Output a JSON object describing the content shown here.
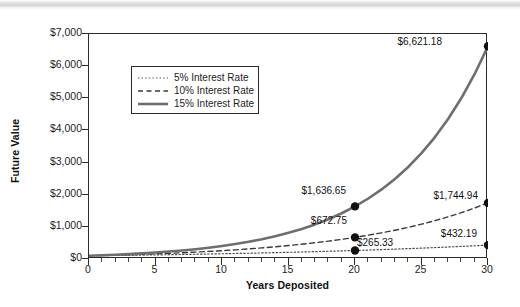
{
  "chart_data": {
    "type": "line",
    "title": "",
    "xlabel": "Years Deposited",
    "ylabel": "Future Value",
    "xlim": [
      0,
      30
    ],
    "ylim": [
      0,
      7000
    ],
    "grid": false,
    "legend_position": "upper-left-inside",
    "x_ticks": [
      0,
      5,
      10,
      15,
      20,
      25,
      30
    ],
    "x_tick_labels": [
      "0",
      "5",
      "10",
      "15",
      "20",
      "25",
      "30"
    ],
    "x_minor_tick_step": 1,
    "y_ticks": [
      0,
      1000,
      2000,
      3000,
      4000,
      5000,
      6000,
      7000
    ],
    "y_tick_labels": [
      "$0",
      "$1,000",
      "$2,000",
      "$3,000",
      "$4,000",
      "$5,000",
      "$6,000",
      "$7,000"
    ],
    "principal": 100,
    "x": [
      0,
      1,
      2,
      3,
      4,
      5,
      6,
      7,
      8,
      9,
      10,
      11,
      12,
      13,
      14,
      15,
      16,
      17,
      18,
      19,
      20,
      21,
      22,
      23,
      24,
      25,
      26,
      27,
      28,
      29,
      30
    ],
    "series": [
      {
        "name": "5% Interest Rate",
        "rate": 0.05,
        "style": "dotted",
        "color": "#4d4d4d",
        "width": 1.2,
        "values": [
          100,
          105,
          110.25,
          115.76,
          121.55,
          127.63,
          134.01,
          140.71,
          147.75,
          155.13,
          162.89,
          171.03,
          179.59,
          188.56,
          197.99,
          207.89,
          218.29,
          229.2,
          240.66,
          252.7,
          265.33,
          278.6,
          292.53,
          307.15,
          322.51,
          338.64,
          355.57,
          373.35,
          392.01,
          411.61,
          432.19
        ],
        "annotated_points": [
          {
            "x": 20,
            "y": 265.33,
            "label": "$265.33"
          },
          {
            "x": 30,
            "y": 432.19,
            "label": "$432.19"
          }
        ]
      },
      {
        "name": "10% Interest Rate",
        "rate": 0.1,
        "style": "dashed",
        "color": "#3a3a3a",
        "width": 1.4,
        "values": [
          100,
          110,
          121,
          133.1,
          146.41,
          161.05,
          177.16,
          194.87,
          214.36,
          235.79,
          259.37,
          285.31,
          313.84,
          345.23,
          379.75,
          417.72,
          459.5,
          505.45,
          555.99,
          611.59,
          672.75,
          740.02,
          814.03,
          895.43,
          984.97,
          1083.47,
          1191.82,
          1311,
          1442.1,
          1586.31,
          1744.94
        ],
        "annotated_points": [
          {
            "x": 20,
            "y": 672.75,
            "label": "$672.75"
          },
          {
            "x": 30,
            "y": 1744.94,
            "label": "$1,744.94"
          }
        ]
      },
      {
        "name": "15% Interest Rate",
        "rate": 0.15,
        "style": "solid",
        "color": "#6e6e6e",
        "width": 2.6,
        "values": [
          100,
          115,
          132.25,
          152.09,
          174.9,
          201.14,
          231.31,
          266.0,
          305.9,
          351.79,
          404.56,
          465.24,
          535.03,
          615.28,
          707.57,
          813.71,
          935.76,
          1076.13,
          1237.55,
          1423.18,
          1636.65,
          1882.15,
          2164.47,
          2489.14,
          2862.52,
          3291.9,
          3785.68,
          4353.53,
          5006.56,
          5757.55,
          6621.18
        ],
        "annotated_points": [
          {
            "x": 20,
            "y": 1636.65,
            "label": "$1,636.65"
          },
          {
            "x": 30,
            "y": 6621.18,
            "label": "$6,621.18"
          }
        ]
      }
    ]
  },
  "axes": {
    "y_title": "Future Value",
    "x_title": "Years Deposited"
  },
  "legend": {
    "entries": [
      {
        "label": "5% Interest Rate",
        "style": "dotted"
      },
      {
        "label": "10% Interest Rate",
        "style": "dashed"
      },
      {
        "label": "15% Interest Rate",
        "style": "solid"
      }
    ]
  },
  "annotations": [
    {
      "key": "p15y30",
      "text": "$6,621.18"
    },
    {
      "key": "p15y20",
      "text": "$1,636.65"
    },
    {
      "key": "p10y30",
      "text": "$1,744.94"
    },
    {
      "key": "p10y20",
      "text": "$672.75"
    },
    {
      "key": "p05y30",
      "text": "$432.19"
    },
    {
      "key": "p05y20",
      "text": "$265.33"
    }
  ],
  "colors": {
    "axis": "#2b2b2b",
    "series_5": "#4d4d4d",
    "series_10": "#3a3a3a",
    "series_15": "#6e6e6e",
    "marker": "#111111",
    "background": "#ffffff"
  }
}
